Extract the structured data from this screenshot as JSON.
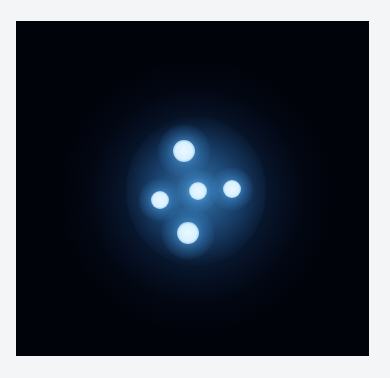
{
  "image": {
    "subject": "quadruply lensed quasar (Einstein cross) in space",
    "background_color": "#f4f5f6",
    "frame_color": "#01030a",
    "halo_color": "#1c5a9a",
    "glow_color": "#4aa8e0",
    "core_color": "#eaf8ff",
    "spots": [
      {
        "name": "top",
        "x": 168,
        "y": 130,
        "r": 11
      },
      {
        "name": "center",
        "x": 182,
        "y": 170,
        "r": 9
      },
      {
        "name": "right",
        "x": 216,
        "y": 168,
        "r": 9
      },
      {
        "name": "left",
        "x": 144,
        "y": 179,
        "r": 9
      },
      {
        "name": "bottom",
        "x": 172,
        "y": 212,
        "r": 11
      }
    ]
  },
  "caption": ""
}
